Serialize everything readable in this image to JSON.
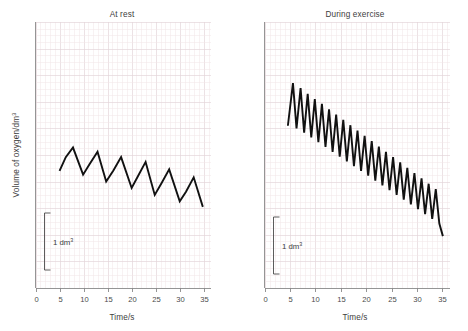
{
  "figure": {
    "background_color": "#ffffff",
    "trace_color": "#111111",
    "grid_minor_color": "#f2e6e8",
    "grid_major_color": "#e4d6da",
    "axis_color": "#8a8a8a"
  },
  "panels": [
    {
      "id": "at-rest",
      "title": "At rest",
      "xlabel": "Time/s",
      "ylabel": "Volume of oxygen/dm",
      "ylabel_sup": "3",
      "scale_bar": {
        "label": "1 dm",
        "label_sup": "3",
        "value": 1,
        "unit": "dm^3"
      },
      "xticks": [
        0,
        5,
        10,
        15,
        20,
        25,
        30,
        35
      ],
      "xticklabels": [
        "0",
        "5",
        "10",
        "15",
        "20",
        "25",
        "30",
        "35"
      ]
    },
    {
      "id": "during-exercise",
      "title": "During exercise",
      "xlabel": "Time/s",
      "ylabel": "",
      "ylabel_sup": "",
      "scale_bar": {
        "label": "1 dm",
        "label_sup": "3",
        "value": 1,
        "unit": "dm^3"
      },
      "xticks": [
        0,
        5,
        10,
        15,
        20,
        25,
        30,
        35
      ],
      "xticklabels": [
        "0",
        "5",
        "10",
        "15",
        "20",
        "25",
        "30",
        "35"
      ]
    }
  ],
  "chart_data": [
    {
      "type": "line",
      "id": "at-rest",
      "title": "At rest",
      "xlabel": "Time/s",
      "ylabel": "Volume of oxygen/dm^3",
      "xlim": [
        0,
        36.5
      ],
      "ylim": [
        0,
        10
      ],
      "grid": true,
      "legend": "none",
      "annotations": [
        {
          "text": "1 dm^3",
          "type": "scale-bar",
          "value": 1,
          "x": 3.6,
          "y_range": [
            1.55,
            3.35
          ]
        }
      ],
      "notes": "Spirometer trace at rest: ~8 breaths over 30 s, breathing rate approx 16 breaths per minute, tidal volume approx 0.5 dm3, slow downward drift showing oxygen consumption.",
      "series": [
        {
          "name": "Spirometer trace at rest",
          "x": [
            5.0,
            6.3,
            7.8,
            9.9,
            11.2,
            12.9,
            14.7,
            16.2,
            17.8,
            20.0,
            21.3,
            22.9,
            24.8,
            26.2,
            27.8,
            30.0,
            31.3,
            32.9,
            34.8
          ],
          "y": [
            4.4,
            4.92,
            5.28,
            4.26,
            4.64,
            5.12,
            4.0,
            4.42,
            4.92,
            3.76,
            4.2,
            4.74,
            3.5,
            3.94,
            4.46,
            3.26,
            3.62,
            4.16,
            3.05
          ]
        }
      ]
    },
    {
      "type": "line",
      "id": "during-exercise",
      "title": "During exercise",
      "xlabel": "Time/s",
      "ylabel": "Volume of oxygen/dm^3",
      "xlim": [
        0,
        36.5
      ],
      "ylim": [
        0,
        10
      ],
      "grid": true,
      "legend": "none",
      "annotations": [
        {
          "text": "1 dm^3",
          "type": "scale-bar",
          "value": 1,
          "x": 3.6,
          "y_range": [
            1.1,
            2.9
          ]
        }
      ],
      "notes": "Spirometer trace during exercise: ~24 breaths over 30 s, breathing rate approx 48 breaths per minute, tidal volume approx 1.2 dm3, steep downward drift showing increased oxygen consumption.",
      "series": [
        {
          "name": "Spirometer trace during exercise",
          "x": [
            4.6,
            5.6,
            6.3,
            7.1,
            7.8,
            8.5,
            9.2,
            9.9,
            10.6,
            11.3,
            12.0,
            12.7,
            13.4,
            14.1,
            14.8,
            15.5,
            16.2,
            16.9,
            17.6,
            18.3,
            19.0,
            19.7,
            20.4,
            21.1,
            21.8,
            22.5,
            23.2,
            23.9,
            24.6,
            25.3,
            26.0,
            26.7,
            27.4,
            28.1,
            28.8,
            29.5,
            30.2,
            30.9,
            31.6,
            32.3,
            33.0,
            33.7,
            34.4,
            35.1
          ],
          "y": [
            6.1,
            7.7,
            6.0,
            7.52,
            5.84,
            7.3,
            5.66,
            7.1,
            5.48,
            6.92,
            5.3,
            6.72,
            5.12,
            6.52,
            4.94,
            6.32,
            4.76,
            6.12,
            4.58,
            5.92,
            4.4,
            5.72,
            4.22,
            5.52,
            4.04,
            5.32,
            3.86,
            5.12,
            3.68,
            4.92,
            3.5,
            4.72,
            3.32,
            4.52,
            3.14,
            4.32,
            2.96,
            4.12,
            2.78,
            3.92,
            2.6,
            3.72,
            2.42,
            1.95
          ]
        }
      ]
    }
  ]
}
